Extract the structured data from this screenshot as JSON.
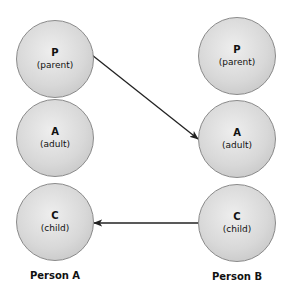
{
  "diagram": {
    "columns": [
      {
        "label": "Person A",
        "nodes": [
          {
            "letter": "P",
            "role": "(parent)"
          },
          {
            "letter": "A",
            "role": "(adult)"
          },
          {
            "letter": "C",
            "role": "(child)"
          }
        ]
      },
      {
        "label": "Person B",
        "nodes": [
          {
            "letter": "P",
            "role": "(parent)"
          },
          {
            "letter": "A",
            "role": "(adult)"
          },
          {
            "letter": "C",
            "role": "(child)"
          }
        ]
      }
    ],
    "arrows": [
      {
        "from": "Person A P (parent)",
        "to": "Person B A (adult)"
      },
      {
        "from": "Person B C (child)",
        "to": "Person A C (child)"
      }
    ],
    "colors": {
      "node_fill": "#d8d8d8",
      "node_border": "#8a8a8a",
      "arrow": "#222222"
    }
  }
}
